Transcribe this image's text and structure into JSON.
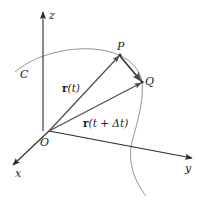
{
  "diagram": {
    "type": "vector-calculus-3d",
    "colors": {
      "axis": "#2a2a2a",
      "vector": "#4a4a4a",
      "secant": "#333333",
      "curve": "#777777",
      "background": "#ffffff"
    },
    "axes": {
      "x_label": "x",
      "y_label": "y",
      "z_label": "z",
      "origin_label": "O"
    },
    "curve": {
      "label": "C"
    },
    "points": {
      "P": "P",
      "Q": "Q"
    },
    "vectors": {
      "r_t": {
        "bold": "r",
        "rest": "(t)"
      },
      "r_t_dt": {
        "bold": "r",
        "rest": "(t + Δt)"
      }
    }
  }
}
